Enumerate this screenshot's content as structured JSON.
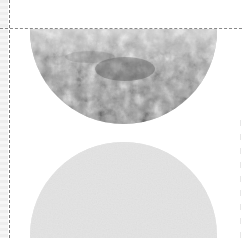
{
  "canvas": {
    "width": 242,
    "height": 238,
    "background": "#ffffff"
  },
  "elements": {
    "top_shape": {
      "kind": "half-circle",
      "fill": "foliage-photo-grayscale"
    },
    "bottom_shape": {
      "kind": "circle",
      "fill": "#e4e4e4"
    },
    "guides": {
      "vertical": "dashed",
      "horizontal": "dashed",
      "color": "#808080"
    }
  },
  "colors": {
    "guide": "#808080",
    "circle_fill": "#e4e4e4",
    "strip": "#eeeeee"
  }
}
